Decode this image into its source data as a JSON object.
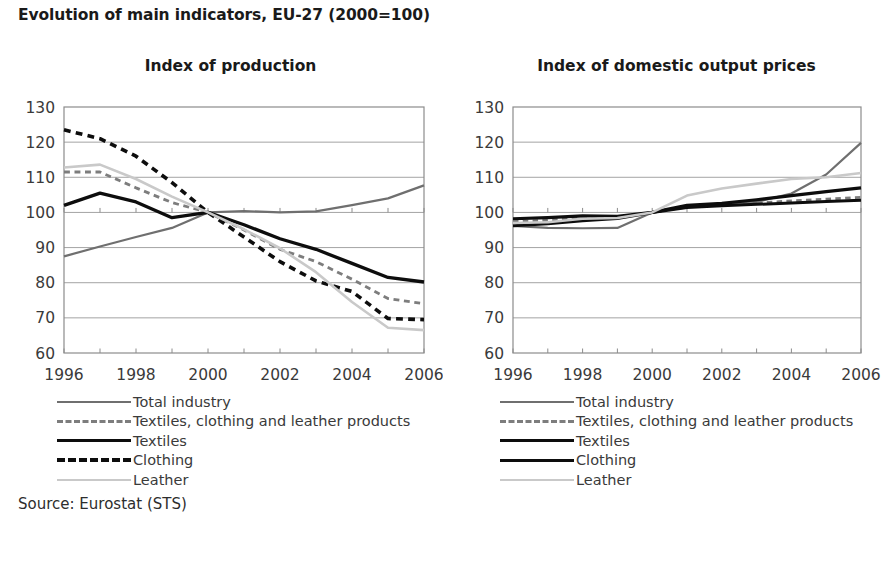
{
  "title": "Evolution of main indicators, EU-27 (2000=100)",
  "source": "Source: Eurostat (STS)",
  "legend": {
    "items": [
      {
        "label": "Total industry",
        "key": "solid-gray"
      },
      {
        "label": "Textiles, clothing and leather products",
        "key": "dash-gray"
      },
      {
        "label": "Textiles",
        "key": "solid-black"
      },
      {
        "label": "Clothing",
        "key": "dash-black"
      },
      {
        "label": "Leather",
        "key": "solid-light"
      }
    ],
    "items_right": [
      {
        "label": "Total industry",
        "key": "solid-gray"
      },
      {
        "label": "Textiles, clothing and leather products",
        "key": "dash-gray"
      },
      {
        "label": "Textiles",
        "key": "solid-black"
      },
      {
        "label": "Clothing",
        "key": "solid-black"
      },
      {
        "label": "Leather",
        "key": "solid-light"
      }
    ]
  },
  "colors": {
    "total_industry": "#6f6f6f",
    "tcl_products": "#7d7d7d",
    "textiles": "#0d0d0d",
    "clothing": "#0d0d0d",
    "leather": "#c9c9c9",
    "grid": "#9a9a9a",
    "axis": "#8c8c8c",
    "text": "#3a3a3a"
  },
  "axis": {
    "y_ticks": [
      60,
      70,
      80,
      90,
      100,
      110,
      120,
      130
    ],
    "ylim": [
      60,
      130
    ],
    "x_ticks_major": [
      1996,
      1998,
      2000,
      2002,
      2004,
      2006
    ],
    "x_tick_labels": [
      "1996",
      "1998",
      "2000",
      "2002",
      "2004",
      "2006"
    ],
    "xlim": [
      1996,
      2006
    ],
    "x_minor": [
      1997,
      1999,
      2001,
      2003,
      2005
    ]
  },
  "chart_data": [
    {
      "type": "line",
      "title": "Index of production",
      "xlabel": "",
      "ylabel": "",
      "ylim": [
        60,
        130
      ],
      "xlim": [
        1996,
        2006
      ],
      "grid": true,
      "legend_position": "below",
      "x": [
        1996,
        1997,
        1998,
        1999,
        2000,
        2001,
        2002,
        2003,
        2004,
        2005,
        2006
      ],
      "series": [
        {
          "name": "Total industry",
          "style": "solid",
          "color": "#6f6f6f",
          "width": 2.2,
          "values": [
            87.5,
            90.3,
            93.0,
            95.6,
            100.0,
            100.4,
            100.0,
            100.3,
            102.1,
            104.0,
            107.7
          ]
        },
        {
          "name": "Textiles, clothing and leather products",
          "style": "dashed",
          "color": "#7d7d7d",
          "width": 2.8,
          "values": [
            111.5,
            111.5,
            107.0,
            102.8,
            100.0,
            95.0,
            89.5,
            86.0,
            81.0,
            75.5,
            74.0
          ]
        },
        {
          "name": "Textiles",
          "style": "solid",
          "color": "#0d0d0d",
          "width": 3.3,
          "values": [
            102.0,
            105.5,
            103.0,
            98.5,
            100.0,
            96.5,
            92.5,
            89.5,
            85.5,
            81.5,
            80.2
          ]
        },
        {
          "name": "Clothing",
          "style": "dashed",
          "color": "#0d0d0d",
          "width": 3.6,
          "values": [
            123.5,
            121.0,
            116.0,
            108.5,
            100.0,
            93.0,
            86.0,
            80.5,
            77.5,
            69.8,
            69.5
          ]
        },
        {
          "name": "Leather",
          "style": "solid",
          "color": "#c9c9c9",
          "width": 2.6,
          "values": [
            112.8,
            113.6,
            109.5,
            104.5,
            100.0,
            95.2,
            89.8,
            83.0,
            74.5,
            67.2,
            66.5
          ]
        }
      ]
    },
    {
      "type": "line",
      "title": "Index of domestic output prices",
      "xlabel": "",
      "ylabel": "",
      "ylim": [
        60,
        130
      ],
      "xlim": [
        1996,
        2006
      ],
      "grid": true,
      "legend_position": "below",
      "x": [
        1996,
        1997,
        1998,
        1999,
        2000,
        2001,
        2002,
        2003,
        2004,
        2005,
        2006
      ],
      "series": [
        {
          "name": "Total industry",
          "style": "solid",
          "color": "#6f6f6f",
          "width": 2.2,
          "values": [
            96.2,
            95.6,
            95.5,
            95.6,
            100.0,
            101.8,
            102.2,
            103.0,
            105.4,
            110.8,
            119.8
          ]
        },
        {
          "name": "Textiles, clothing and leather products",
          "style": "dashed",
          "color": "#7d7d7d",
          "width": 2.6,
          "values": [
            97.4,
            97.8,
            98.4,
            98.7,
            100.0,
            101.5,
            102.2,
            102.7,
            103.3,
            103.8,
            104.3
          ]
        },
        {
          "name": "Textiles",
          "style": "solid",
          "color": "#0d0d0d",
          "width": 3.2,
          "values": [
            98.2,
            98.5,
            99.0,
            98.9,
            100.0,
            102.0,
            102.6,
            103.6,
            104.8,
            105.9,
            107.0
          ]
        },
        {
          "name": "Clothing",
          "style": "solid",
          "color": "#0d0d0d",
          "width": 3.0,
          "values": [
            96.2,
            96.8,
            97.6,
            98.3,
            100.0,
            101.4,
            101.9,
            102.3,
            102.7,
            103.1,
            103.5
          ]
        },
        {
          "name": "Leather",
          "style": "solid",
          "color": "#c9c9c9",
          "width": 2.6,
          "values": [
            97.0,
            97.2,
            98.2,
            98.4,
            100.0,
            104.8,
            106.8,
            108.2,
            109.5,
            110.0,
            111.2
          ]
        }
      ]
    }
  ]
}
